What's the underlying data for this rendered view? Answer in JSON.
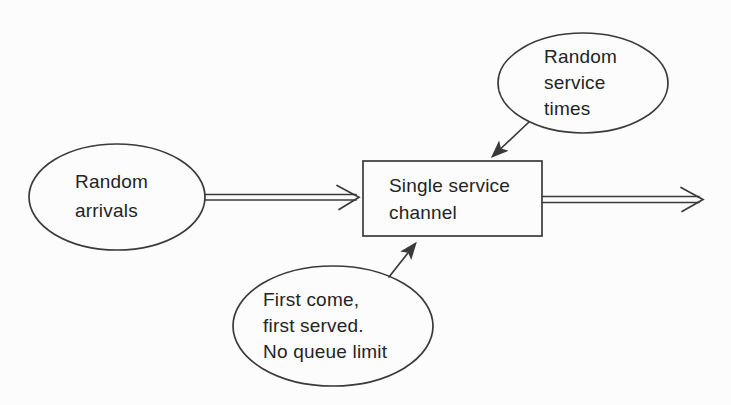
{
  "diagram": {
    "type": "flow-diagram",
    "colors": {
      "background": "#fcfcfc",
      "stroke": "#3a3a3a",
      "text": "#242424"
    },
    "nodes": {
      "random_arrivals": {
        "shape": "ellipse",
        "lines": [
          "Random",
          "arrivals"
        ]
      },
      "single_service_channel": {
        "shape": "rectangle",
        "lines": [
          "Single service",
          "channel"
        ]
      },
      "random_service_times": {
        "shape": "ellipse",
        "lines": [
          "Random",
          "service",
          "times"
        ]
      },
      "first_come_first_served": {
        "shape": "ellipse",
        "lines": [
          "First come,",
          "first served.",
          "No queue limit"
        ]
      }
    },
    "connectors": [
      {
        "name": "arrivals-to-channel",
        "style": "double-line, open arrowhead",
        "from": "random_arrivals",
        "to": "single_service_channel"
      },
      {
        "name": "channel-to-exit",
        "style": "double-line, open arrowhead",
        "from": "single_service_channel",
        "to": "exit-right"
      },
      {
        "name": "service-times-to-channel",
        "style": "single line, filled arrowhead",
        "from": "random_service_times",
        "to": "single_service_channel"
      },
      {
        "name": "fcfs-to-channel",
        "style": "single line, filled arrowhead",
        "from": "first_come_first_served",
        "to": "single_service_channel"
      }
    ]
  }
}
